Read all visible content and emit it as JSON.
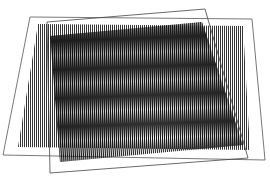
{
  "scene": {
    "description": "Two overlapping transparent sheets printed with fine parallel line gratings, slightly rotated relative to each other, producing a radial moire fan pattern",
    "background": "#ffffff",
    "ink": "#111111",
    "sheet_edge_color": "#555555",
    "sheets": [
      {
        "name": "back-sheet",
        "outline": "30,17 252,19 265,160 3,155",
        "grating_area": "38,24 243,26 250,150 18,147",
        "line_angle_deg": 0,
        "line_period_px": 2.0
      },
      {
        "name": "front-sheet",
        "outline": "47,22 205,9 248,158 50,173",
        "grating_area": "50,36 202,22 243,145 60,162",
        "line_angle_deg": -4,
        "line_period_px": 2.0
      }
    ],
    "moire_focus": {
      "x": 155,
      "y": 138
    }
  }
}
